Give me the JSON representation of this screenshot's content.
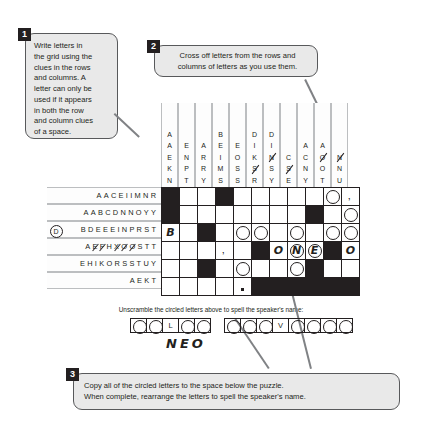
{
  "callouts": [
    {
      "number": "1",
      "lines": [
        "Write letters in",
        "the grid using the",
        "clues in the rows",
        "and columns. A",
        "letter can only be",
        "used if it appears",
        "in both the row",
        "and column clues",
        "of a space."
      ]
    },
    {
      "number": "2",
      "lines": [
        "Cross off letters from the rows and",
        "columns of letters as you use them."
      ]
    },
    {
      "number": "3",
      "lines": [
        "Copy all of the circled letters to the space below the puzzle.",
        "When complete, rearrange the letters to spell the speaker's name."
      ]
    }
  ],
  "column_clues": [
    {
      "letters": [
        "A",
        "A",
        "E",
        "K",
        "N"
      ],
      "struck": []
    },
    {
      "letters": [
        "E",
        "N",
        "P",
        "T"
      ],
      "struck": []
    },
    {
      "letters": [
        "A",
        "R",
        "R",
        "Y"
      ],
      "struck": []
    },
    {
      "letters": [
        "B",
        "E",
        "I",
        "M",
        "S"
      ],
      "struck": []
    },
    {
      "letters": [
        "E",
        "O",
        "S",
        "S"
      ],
      "struck": []
    },
    {
      "letters": [
        "D",
        "I",
        "K",
        "S",
        "R"
      ],
      "struck": [
        3
      ]
    },
    {
      "letters": [
        "D",
        "I",
        "N",
        "S",
        "Y"
      ],
      "struck": [
        2
      ]
    },
    {
      "letters": [
        "C",
        "S",
        "E"
      ],
      "struck": [
        1
      ]
    },
    {
      "letters": [
        "A",
        "C",
        "N",
        "Y"
      ],
      "struck": []
    },
    {
      "letters": [
        "A",
        "O",
        "O",
        "T"
      ],
      "struck": [
        1
      ]
    },
    {
      "letters": [
        "N",
        "N",
        "U"
      ],
      "struck": [
        0
      ]
    }
  ],
  "row_clues": [
    {
      "circle": "",
      "letters": [
        "A",
        "A",
        "C",
        "E",
        "I",
        "I",
        "M",
        "N",
        "R"
      ],
      "struck": []
    },
    {
      "circle": "",
      "letters": [
        "A",
        "A",
        "B",
        "C",
        "D",
        "N",
        "N",
        "O",
        "Y",
        "Y"
      ],
      "struck": []
    },
    {
      "circle": "D",
      "letters": [
        "B",
        "D",
        "E",
        "E",
        "E",
        "I",
        "N",
        "P",
        "R",
        "S",
        "T"
      ],
      "struck": []
    },
    {
      "circle": "",
      "letters": [
        "A",
        "E",
        "F",
        "H",
        "X",
        "O",
        "O",
        "S",
        "T",
        "T"
      ],
      "struck": [
        1,
        2,
        4,
        5,
        6
      ]
    },
    {
      "circle": "",
      "letters": [
        "E",
        "H",
        "I",
        "K",
        "O",
        "R",
        "S",
        "S",
        "T",
        "U",
        "Y"
      ],
      "struck": []
    },
    {
      "circle": "",
      "letters": [
        "A",
        "E",
        "K",
        "T"
      ],
      "struck": []
    }
  ],
  "grid": {
    "rows": 6,
    "cols": 11,
    "cells": [
      [
        {
          "t": "black"
        },
        {
          "t": "open"
        },
        {
          "t": "open"
        },
        {
          "t": "black"
        },
        {
          "t": "open"
        },
        {
          "t": "open"
        },
        {
          "t": "open"
        },
        {
          "t": "open"
        },
        {
          "t": "open"
        },
        {
          "t": "circle"
        },
        {
          "t": "comma"
        }
      ],
      [
        {
          "t": "black"
        },
        {
          "t": "open"
        },
        {
          "t": "open"
        },
        {
          "t": "open"
        },
        {
          "t": "open"
        },
        {
          "t": "open"
        },
        {
          "t": "open"
        },
        {
          "t": "open"
        },
        {
          "t": "black"
        },
        {
          "t": "open"
        },
        {
          "t": "circle"
        }
      ],
      [
        {
          "t": "letter",
          "v": "B"
        },
        {
          "t": "open"
        },
        {
          "t": "black"
        },
        {
          "t": "open"
        },
        {
          "t": "circle"
        },
        {
          "t": "circle"
        },
        {
          "t": "open"
        },
        {
          "t": "circle"
        },
        {
          "t": "open"
        },
        {
          "t": "circle"
        },
        {
          "t": "circle"
        }
      ],
      [
        {
          "t": "open"
        },
        {
          "t": "open"
        },
        {
          "t": "open"
        },
        {
          "t": "comma"
        },
        {
          "t": "open"
        },
        {
          "t": "black"
        },
        {
          "t": "letter",
          "v": "O"
        },
        {
          "t": "circleletter",
          "v": "N"
        },
        {
          "t": "circleletter",
          "v": "E"
        },
        {
          "t": "black"
        },
        {
          "t": "letter",
          "v": "O"
        }
      ],
      [
        {
          "t": "open"
        },
        {
          "t": "open"
        },
        {
          "t": "black"
        },
        {
          "t": "open"
        },
        {
          "t": "circle"
        },
        {
          "t": "open"
        },
        {
          "t": "open"
        },
        {
          "t": "circle"
        },
        {
          "t": "black"
        },
        {
          "t": "open"
        },
        {
          "t": "open"
        }
      ],
      [
        {
          "t": "open"
        },
        {
          "t": "open"
        },
        {
          "t": "open"
        },
        {
          "t": "open"
        },
        {
          "t": "dot"
        },
        {
          "t": "black"
        },
        {
          "t": "black"
        },
        {
          "t": "black"
        },
        {
          "t": "black"
        },
        {
          "t": "black"
        },
        {
          "t": "black"
        }
      ]
    ]
  },
  "unscramble": {
    "instruction": "Unscramble the circled letters above to spell the speaker's name:",
    "words": [
      {
        "boxes": [
          {
            "circle": true,
            "letter": ""
          },
          {
            "circle": true,
            "letter": ""
          },
          {
            "circle": false,
            "letter": "L"
          },
          {
            "circle": true,
            "letter": ""
          },
          {
            "circle": true,
            "letter": ""
          }
        ]
      },
      {
        "boxes": [
          {
            "circle": true,
            "letter": ""
          },
          {
            "circle": true,
            "letter": ""
          },
          {
            "circle": true,
            "letter": ""
          },
          {
            "circle": false,
            "letter": "V"
          },
          {
            "circle": true,
            "letter": ""
          },
          {
            "circle": true,
            "letter": ""
          },
          {
            "circle": true,
            "letter": ""
          },
          {
            "circle": true,
            "letter": ""
          }
        ]
      }
    ],
    "handwritten_answer": "NEO"
  },
  "colors": {
    "ink": "#231f20",
    "callout_bg": "#e9e9e9",
    "callout_border": "#58595b",
    "clue_rule": "#bcbec0"
  }
}
